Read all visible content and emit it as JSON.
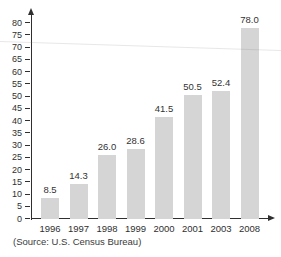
{
  "figure": {
    "source_note": "(Source: U.S. Census Bureau)"
  },
  "chart_data": {
    "type": "bar",
    "categories": [
      "1996",
      "1997",
      "1998",
      "1999",
      "2000",
      "2001",
      "2003",
      "2008"
    ],
    "values": [
      8.5,
      14.3,
      26.0,
      28.6,
      41.5,
      50.5,
      52.4,
      78.0
    ],
    "bar_labels": [
      "8.5",
      "14.3",
      "26.0",
      "28.6",
      "41.5",
      "50.5",
      "52.4",
      "78.0"
    ],
    "title": "",
    "xlabel": "",
    "ylabel": "",
    "ylim": [
      0,
      80
    ],
    "ytick_step": 5,
    "grid": false,
    "legend": null,
    "bar_color": "#d5d5d5",
    "axis_color": "#2f2f2f",
    "label_color": "#333333",
    "background_color": "#ffffff"
  }
}
